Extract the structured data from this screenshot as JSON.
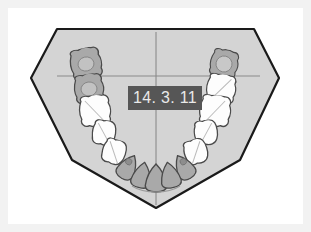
{
  "figure": {
    "kind": "dental-arch-chart",
    "caption_label": "14. 3. 11",
    "background_color": "#f2f2f2",
    "mat_color": "#ffffff",
    "arch_fill_color": "#d4d4d4",
    "arch_outline_color": "#1a1a1a",
    "crosshair_color": "#8a8a8a",
    "tooth_white_fill": "#fdfdfd",
    "tooth_shaded_fill": "#a9a9a9",
    "tooth_outline_color": "#4a4a4a",
    "label_background": "#565656",
    "label_text_color": "#e9e9e9"
  },
  "label": {
    "text": "14. 3. 11",
    "x": 120,
    "y": 78,
    "width": 74,
    "height": 24
  },
  "arch_outline": {
    "points": "57,29 254,29 279,78 240,160 156,208 72,160 31,78",
    "description": "pentagon-style dental chart boundary"
  },
  "crosshair": {
    "vertical": {
      "x": 156,
      "y1": 32,
      "y2": 205
    },
    "horizontal": {
      "y": 76,
      "x1": 57,
      "x2": 260
    }
  },
  "teeth": {
    "quadrant_left": [
      {
        "id": "upper-left-molar-1",
        "cx": 86,
        "cy": 64,
        "rx": 15,
        "ry": 13,
        "shape": "molar",
        "state": "shaded",
        "rot": -12
      },
      {
        "id": "upper-left-molar-2",
        "cx": 89,
        "cy": 89,
        "rx": 14,
        "ry": 12,
        "shape": "molar",
        "state": "shaded",
        "rot": -8
      },
      {
        "id": "upper-left-molar-3",
        "cx": 95,
        "cy": 111,
        "rx": 15,
        "ry": 13,
        "shape": "molar",
        "state": "white",
        "rot": -6
      },
      {
        "id": "upper-left-premolar-1",
        "cx": 104,
        "cy": 133,
        "rx": 12,
        "ry": 11,
        "shape": "premolar",
        "state": "white",
        "rot": 8
      },
      {
        "id": "upper-left-premolar-2",
        "cx": 114,
        "cy": 152,
        "rx": 12,
        "ry": 11,
        "shape": "premolar",
        "state": "white",
        "rot": 18
      },
      {
        "id": "upper-left-canine",
        "cx": 128,
        "cy": 167,
        "rx": 11,
        "ry": 12,
        "shape": "canine",
        "state": "shaded",
        "rot": 30
      },
      {
        "id": "upper-left-lateral",
        "cx": 142,
        "cy": 175,
        "rx": 10,
        "ry": 12,
        "shape": "incisor",
        "state": "shaded",
        "rot": 12
      },
      {
        "id": "upper-left-central",
        "cx": 156,
        "cy": 178,
        "rx": 11,
        "ry": 13,
        "shape": "incisor",
        "state": "shaded",
        "rot": 0
      }
    ],
    "quadrant_right": [
      {
        "id": "upper-right-molar-1",
        "cx": 224,
        "cy": 64,
        "rx": 15,
        "ry": 13,
        "shape": "molar",
        "state": "shaded",
        "rot": 12
      },
      {
        "id": "upper-right-molar-2",
        "cx": 221,
        "cy": 89,
        "rx": 14,
        "ry": 12,
        "shape": "molar",
        "state": "white",
        "rot": 8
      },
      {
        "id": "upper-right-molar-3",
        "cx": 215,
        "cy": 111,
        "rx": 15,
        "ry": 13,
        "shape": "molar",
        "state": "white",
        "rot": 6
      },
      {
        "id": "upper-right-premolar-1",
        "cx": 206,
        "cy": 133,
        "rx": 12,
        "ry": 11,
        "shape": "premolar",
        "state": "white",
        "rot": -8
      },
      {
        "id": "upper-right-premolar-2",
        "cx": 196,
        "cy": 152,
        "rx": 12,
        "ry": 11,
        "shape": "premolar",
        "state": "white",
        "rot": -18
      },
      {
        "id": "upper-right-canine",
        "cx": 184,
        "cy": 167,
        "rx": 11,
        "ry": 12,
        "shape": "canine",
        "state": "shaded",
        "rot": -30
      },
      {
        "id": "upper-right-lateral",
        "cx": 170,
        "cy": 175,
        "rx": 10,
        "ry": 12,
        "shape": "incisor",
        "state": "shaded",
        "rot": -12
      }
    ]
  },
  "counts": {
    "total_teeth": 15,
    "shaded_teeth": 7,
    "white_teeth": 8
  }
}
